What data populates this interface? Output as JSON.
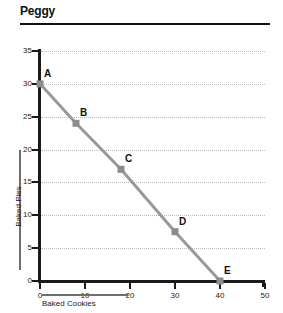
{
  "title": "Peggy",
  "chart_data": {
    "type": "line",
    "title": "Peggy",
    "xlabel": "Baked Cookies",
    "ylabel": "Baked Pies",
    "xlim": [
      0,
      50
    ],
    "ylim": [
      0,
      35
    ],
    "xticks": [
      0,
      10,
      20,
      30,
      40,
      50
    ],
    "yticks": [
      0,
      5,
      10,
      15,
      20,
      25,
      30,
      35
    ],
    "grid": "horizontal-dotted",
    "legend": "none",
    "line_color": "#999999",
    "marker_color": "#8c8c8c",
    "axis_color": "#1a1a1a",
    "points": [
      {
        "label": "A",
        "x": 0,
        "y": 30
      },
      {
        "label": "B",
        "x": 8,
        "y": 24
      },
      {
        "label": "C",
        "x": 18,
        "y": 17
      },
      {
        "label": "D",
        "x": 30,
        "y": 7.5
      },
      {
        "label": "E",
        "x": 40,
        "y": 0
      }
    ],
    "series": [
      {
        "name": "Peggy",
        "x": [
          0,
          8,
          18,
          30,
          40
        ],
        "values": [
          30,
          24,
          17,
          7.5,
          0
        ]
      }
    ]
  }
}
